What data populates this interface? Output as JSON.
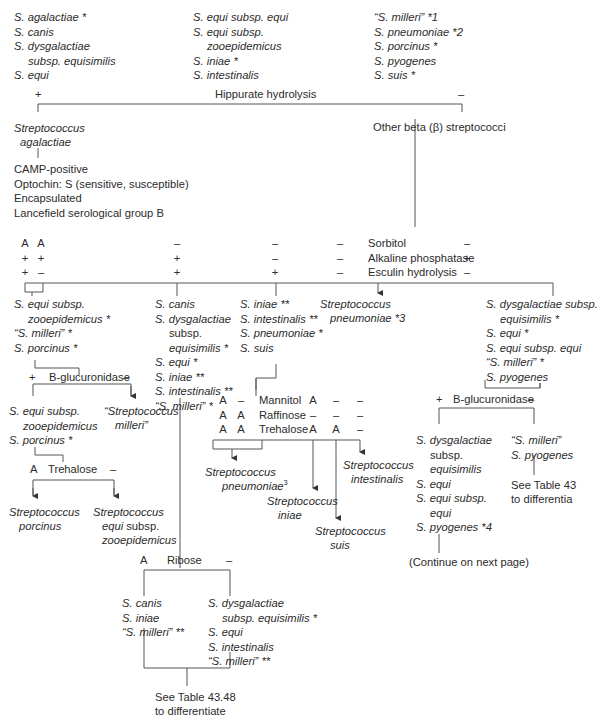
{
  "top_species": {
    "col1": [
      "S. agalactiae *",
      "S. canis",
      "S. dysgalactiae",
      "subsp. equisimilis",
      "S. equi"
    ],
    "col2": [
      "S. equi subsp. equi",
      "S. equi subsp.",
      "zooepidemicus",
      "S. iniae *",
      "S. intestinalis"
    ],
    "col3": [
      "“S. milleri” *1",
      "S. pneumoniae *2",
      "S. porcinus *",
      "S. pyogenes",
      "S. suis *"
    ]
  },
  "hippurate": {
    "pos": "+",
    "label": "Hippurate hydrolysis",
    "neg": "–"
  },
  "agalactiae": {
    "name_line1": "Streptococcus",
    "name_line2": "agalactiae",
    "traits": [
      "CAMP-positive",
      "Optochin: S (sensitive, susceptible)",
      "Encapsulated",
      "Lancefield serological group B"
    ]
  },
  "other_beta": {
    "label": "Other beta (β) streptococci"
  },
  "tests1": {
    "labels": [
      "Sorbitol",
      "Alkaline phosphatase",
      "Esculin hydrolysis"
    ],
    "col_a1": [
      "A",
      "+",
      "+"
    ],
    "col_a2": [
      "A",
      "+",
      "–"
    ],
    "col_b": [
      "–",
      "+",
      "+"
    ],
    "col_c": [
      "–",
      "–",
      "+"
    ],
    "col_d": [
      "–",
      "–",
      "–"
    ],
    "col_e": [
      "–",
      "+",
      "–"
    ]
  },
  "group1": {
    "lines": [
      "S. equi subsp.",
      "zooepidemicus *",
      "“S. milleri” *",
      "S. porcinus *"
    ]
  },
  "group2": {
    "lines": [
      "S. canis",
      "S. dysgalactiae",
      "subsp.",
      "equisimilis *",
      "S. equi *",
      "S. iniae **",
      "S. intestinalis **",
      "“S. milleri” *"
    ]
  },
  "group3": {
    "lines": [
      "S. iniae **",
      "S. intestinalis **",
      "S. pneumoniae *",
      "S. suis"
    ]
  },
  "group4": {
    "line1": "Streptococcus",
    "line2": "pneumoniae *3"
  },
  "group5": {
    "lines": [
      "S. dysgalactiae subsp.",
      "equisimilis *",
      "S. equi *",
      "S. equi subsp. equi",
      "“S. milleri” *",
      "S. pyogenes"
    ]
  },
  "bgluc_left": {
    "pos": "+",
    "label": "B-glucuronidase",
    "neg": "–"
  },
  "bgluc_left_pos": {
    "lines": [
      "S. equi subsp.",
      "zooepidemicus",
      "S. porcinus *"
    ]
  },
  "bgluc_left_neg": {
    "line1": "“Streptococcus",
    "line2": "milleri”"
  },
  "trehalose_left": {
    "pos": "A",
    "label": "Trehalose",
    "neg": "–"
  },
  "trehalose_left_pos": {
    "line1": "Streptococcus",
    "line2": "porcinus"
  },
  "trehalose_left_neg": {
    "line1": "Streptococcus",
    "line2": "equi subsp.",
    "line3": "zooepidemicus"
  },
  "tests2": {
    "labels": [
      "Mannitol",
      "Raffinose",
      "Trehalose"
    ],
    "col1": [
      "A",
      "A",
      "A"
    ],
    "col2": [
      "–",
      "A",
      "A"
    ],
    "col3": [
      "A",
      "–",
      "A"
    ],
    "col4": [
      "–",
      "–",
      "A"
    ],
    "col5": [
      "–",
      "–",
      "–"
    ]
  },
  "mid_results": {
    "pneumoniae": {
      "line1": "Streptococcus",
      "line2": "pneumoniae",
      "sup": "3"
    },
    "iniae": {
      "line1": "Streptococcus",
      "line2": "iniae"
    },
    "suis": {
      "line1": "Streptococcus",
      "line2": "suis"
    },
    "intestinalis": {
      "line1": "Streptococcus",
      "line2": "intestinalis"
    }
  },
  "bgluc_right": {
    "pos": "+",
    "label": "B-glucuronidase",
    "neg": "–"
  },
  "bgluc_right_pos": {
    "lines": [
      "S. dysgalactiae",
      "subsp.",
      "equisimilis",
      "S. equi",
      "S. equi subsp.",
      "equi",
      "S. pyogenes *4"
    ]
  },
  "bgluc_right_neg": {
    "lines": [
      "“S. milleri”",
      "S. pyogenes"
    ]
  },
  "see_table_right": {
    "line1": "See Table 43",
    "line2": "to differentia"
  },
  "continue_note": "(Continue on next page)",
  "ribose": {
    "pos": "A",
    "label": "Ribose",
    "neg": "–"
  },
  "ribose_pos": {
    "lines": [
      "S. canis",
      "S. iniae",
      "“S. milleri” **"
    ]
  },
  "ribose_neg": {
    "lines": [
      "S. dysgalactiae",
      "subsp. equisimilis *",
      "S. equi",
      "S. intestinalis",
      "“S. milleri” **"
    ]
  },
  "see_table_bottom": {
    "line1": "See Table 43.48",
    "line2": "to differentiate"
  }
}
